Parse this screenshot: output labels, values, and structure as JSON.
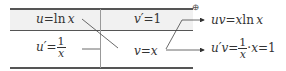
{
  "table": {
    "row1": {
      "left": {
        "lhs": "u",
        "eq": "=",
        "rhs_fn": "ln",
        "rhs_var": "x"
      },
      "right": {
        "lhs": "v′",
        "eq": "=",
        "rhs": "1"
      }
    },
    "row2": {
      "left": {
        "lhs": "u′",
        "eq": "=",
        "frac_num": "1",
        "frac_den": "x"
      },
      "right": {
        "lhs": "v",
        "eq": "=",
        "rhs": "x"
      }
    }
  },
  "sign_marker": "⊕",
  "results": {
    "first": {
      "lhs": "uv",
      "eq": "=",
      "rhs": "x",
      "fn": "ln",
      "var": "x"
    },
    "second": {
      "lhs": "u′v",
      "eq": "=",
      "frac_num": "1",
      "frac_den": "x",
      "dot": "·",
      "mid": "x",
      "eq2": "=",
      "val": "1"
    }
  },
  "colors": {
    "line": "#555555",
    "header_bg": "#f1f1f1",
    "text": "#333333"
  }
}
